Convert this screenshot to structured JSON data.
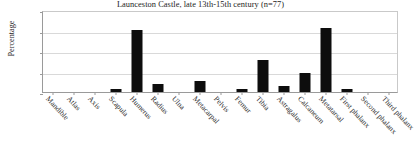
{
  "chart_data": {
    "type": "bar",
    "title": "Launceston Castle, late 13th-15th century  (n=77)",
    "xlabel": "",
    "ylabel": "Percentage",
    "ylim": [
      0,
      40
    ],
    "yticks": [
      0,
      10,
      20,
      30,
      40
    ],
    "grid": true,
    "legend": "none",
    "categories": [
      "Mandible",
      "Atlas",
      "Axis",
      "Scapula",
      "Humerus",
      "Radius",
      "Ulna",
      "Metacarpal",
      "Pelvis",
      "Femur",
      "Tibia",
      "Astragalus",
      "Calcaneum",
      "Metatarsal",
      "First phalanx",
      "Second phalanx",
      "Third phalanx"
    ],
    "values": [
      0,
      0,
      0,
      1.3,
      30.2,
      4.0,
      0,
      5.5,
      0,
      1.5,
      15.5,
      3.0,
      9.2,
      31.0,
      1.7,
      0,
      0
    ],
    "bar_color": "#0d0d0d",
    "axis_color": "#9a9a9a",
    "grid_color": "#d9d9d9"
  }
}
